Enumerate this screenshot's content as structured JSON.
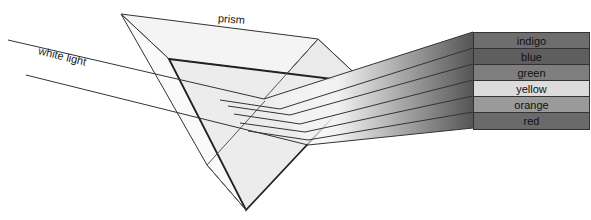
{
  "labels": {
    "prism": "prism",
    "white_light": "white light"
  },
  "spectrum": [
    {
      "name": "indigo",
      "color": "#6e6e6e"
    },
    {
      "name": "blue",
      "color": "#5e5e5e"
    },
    {
      "name": "green",
      "color": "#7e7e7e"
    },
    {
      "name": "yellow",
      "color": "#dcdcdc"
    },
    {
      "name": "orange",
      "color": "#9a9a9a"
    },
    {
      "name": "red",
      "color": "#6a6a6a"
    }
  ]
}
